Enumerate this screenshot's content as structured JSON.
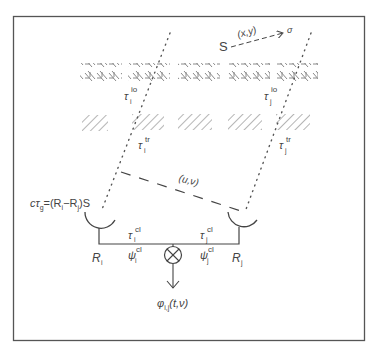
{
  "diagram": {
    "source": {
      "label": "S",
      "coord_label": "(x,y)",
      "target_label": "σ"
    },
    "layers": {
      "ionosphere": {
        "label_i": "τ",
        "sup_i": "io",
        "sub_i": "i",
        "label_j": "τ",
        "sup_j": "io",
        "sub_j": "j"
      },
      "troposphere": {
        "label_i": "τ",
        "sup_i": "tr",
        "sub_i": "i",
        "label_j": "τ",
        "sup_j": "tr",
        "sub_j": "j"
      }
    },
    "baseline": {
      "label": "(u,ν)"
    },
    "geometric_delay": {
      "text": "cτ",
      "sub": "g",
      "eq": "=(R",
      "sub_i": "i",
      "minus": "−R",
      "sub_j": "j",
      "end": ")S"
    },
    "antennas": [
      {
        "label": "R",
        "sub": "i",
        "clock_tau": "τ",
        "clock_tau_sub": "i",
        "clock_sup": "cl",
        "clock_psi": "ψ",
        "psi_sub": "i",
        "psi_sup": "cl"
      },
      {
        "label": "R",
        "sub": "j",
        "clock_tau": "τ",
        "clock_tau_sub": "j",
        "clock_sup": "cl",
        "clock_psi": "ψ",
        "psi_sub": "j",
        "psi_sup": "cl"
      }
    ],
    "correlator": {
      "symbol": "multiply",
      "output": "φ",
      "output_sub": "i,j",
      "output_args": "(t,ν)"
    },
    "colors": {
      "frame": "#555555",
      "lines": "#444444",
      "hatch": "#777777"
    }
  }
}
